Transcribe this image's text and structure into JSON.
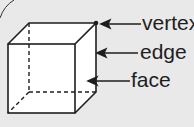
{
  "diagram": {
    "shape": "cube",
    "labels": [
      {
        "id": "vertex",
        "text": "vertex"
      },
      {
        "id": "edge",
        "text": "edge"
      },
      {
        "id": "face",
        "text": "face"
      }
    ],
    "colors": {
      "background": "#e9e9e9",
      "cube_fill": "#ffffff",
      "line": "#1e1e1e"
    }
  }
}
